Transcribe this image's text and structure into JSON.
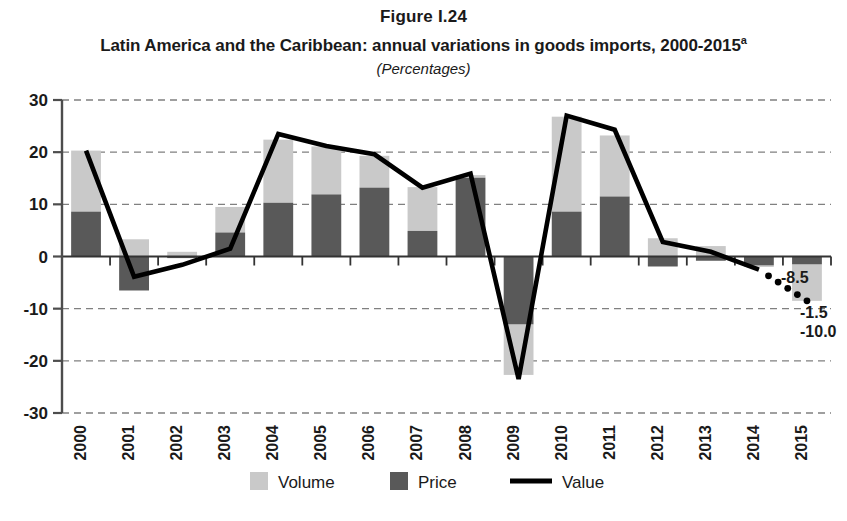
{
  "header": {
    "figure_number": "Figure I.24",
    "title": "Latin America and the Caribbean: annual variations in goods imports, 2000-2015",
    "title_footnote_marker": "a",
    "subtitle": "(Percentages)"
  },
  "colors": {
    "volume": "#c9c9c9",
    "price": "#595959",
    "value": "#000000",
    "axis": "#4d4d4d",
    "gridline": "#808080",
    "background": "#ffffff",
    "text": "#1a1a1a"
  },
  "legend": {
    "position": "bottom",
    "items": [
      {
        "label": "Volume",
        "marker": "filled-square",
        "color": "#c9c9c9"
      },
      {
        "label": "Price",
        "marker": "filled-square",
        "color": "#595959"
      },
      {
        "label": "Value",
        "marker": "line",
        "color": "#000000"
      }
    ]
  },
  "chart_data": {
    "type": "bar",
    "title": "Latin America and the Caribbean: annual variations in goods imports, 2000-2015",
    "subtitle": "(Percentages)",
    "xlabel": "",
    "ylabel": "",
    "ylim": [
      -30,
      30
    ],
    "yticks": [
      30,
      20,
      10,
      0,
      -10,
      -20,
      -30
    ],
    "ytick_labels": [
      "30",
      "20",
      "10",
      "0",
      "-10",
      "-20",
      "-30"
    ],
    "grid": true,
    "grid_axis": "y",
    "stacked": true,
    "categories": [
      "2000",
      "2001",
      "2002",
      "2003",
      "2004",
      "2005",
      "2006",
      "2007",
      "2008",
      "2009",
      "2010",
      "2011",
      "2012",
      "2013",
      "2014",
      "2015"
    ],
    "series": [
      {
        "name": "Price",
        "kind": "bar",
        "color": "#595959",
        "values": [
          8.6,
          -6.5,
          -0.3,
          4.6,
          10.3,
          11.9,
          13.2,
          4.9,
          15.1,
          -13.0,
          8.6,
          11.5,
          -1.9,
          -0.8,
          -1.7,
          -1.5
        ]
      },
      {
        "name": "Volume",
        "kind": "bar",
        "color": "#c9c9c9",
        "values": [
          11.7,
          9.8,
          1.2,
          4.9,
          12.1,
          9.2,
          6.1,
          8.4,
          0.5,
          -9.7,
          18.2,
          11.7,
          5.4,
          2.8,
          -0.3,
          -7.0
        ]
      },
      {
        "name": "Value",
        "kind": "line",
        "color": "#000000",
        "values": [
          20.3,
          -3.9,
          -1.6,
          1.5,
          23.5,
          21.2,
          19.6,
          13.2,
          15.9,
          -23.5,
          27.0,
          24.3,
          2.8,
          0.9,
          -2.5,
          -8.5
        ],
        "dashed_from_index": 14
      }
    ],
    "annotations": [
      {
        "text": "-8.5",
        "refers_to": "Value 2015",
        "value": -8.5
      },
      {
        "text": "-1.5",
        "refers_to": "Price 2015",
        "value": -1.5
      },
      {
        "text": "-10.0",
        "refers_to": "Volume 2015",
        "value": -10.0
      }
    ]
  }
}
